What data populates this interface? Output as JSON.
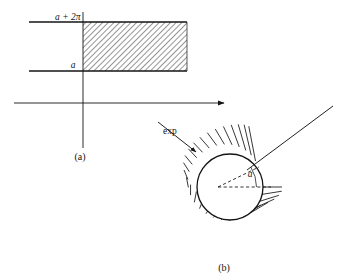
{
  "figure": {
    "background_color": "#ffffff",
    "ink_color": "#141414",
    "panels": [
      {
        "id": "panel-a",
        "caption": "(a)",
        "caption_x": 80,
        "caption_y": 160,
        "description": "horizontal strip in the complex plane between a and a + 2π, hatched to the right of the vertical axis",
        "labels": [
          {
            "name": "upper-bound-label",
            "text": "a + 2π",
            "x": 55,
            "y": 20,
            "style": "italic"
          },
          {
            "name": "lower-bound-label",
            "text": "a",
            "x": 73,
            "y": 68,
            "style": "italic"
          }
        ],
        "axes": {
          "horizontal_axis": {
            "x1": 14,
            "y1": 103,
            "x2": 228,
            "y2": 103,
            "arrow": "right"
          },
          "vertical_axis": {
            "x1": 83,
            "y1": 12,
            "x2": 83,
            "y2": 148,
            "arrow": "none"
          }
        },
        "strip": {
          "top_line": {
            "x1": 29,
            "y1": 22,
            "x2": 187,
            "y2": 22
          },
          "bottom_line": {
            "x1": 29,
            "y1": 71,
            "x2": 187,
            "y2": 71
          },
          "hatch_region": {
            "x": 83,
            "y": 22,
            "width": 104,
            "height": 49
          },
          "hatch_angle_deg": 45,
          "hatch_spacing": 4
        }
      },
      {
        "id": "panel-b",
        "caption": "(b)",
        "caption_x": 222,
        "caption_y": 271,
        "description": "circle with radial spokes (image of the strip under exp), a dashed radius at angle a from the dashed horizontal radius",
        "circle": {
          "cx": 230,
          "cy": 187,
          "r": 33
        },
        "spokes": {
          "count": 28,
          "inner_r": 33,
          "outer_r": 52
        },
        "angle_label": {
          "name": "angle-a-label",
          "text": "a",
          "x": 249,
          "y": 176,
          "style": "italic"
        },
        "angle_value_deg": 35,
        "dashed_radius_horizontal": {
          "from_cx": true,
          "to_x": 271,
          "to_y": 187
        },
        "dashed_radius_angled": {
          "from_cx": true,
          "to_x": 257,
          "to_y": 168
        },
        "exp_label": {
          "name": "exp-label",
          "text": "exp",
          "x": 163,
          "y": 132
        },
        "exp_arrow": {
          "x1": 160,
          "y1": 124,
          "x2": 198,
          "y2": 153,
          "arrow": "end"
        },
        "long_ray": {
          "x1": 247,
          "y1": 170,
          "x2": 333,
          "y2": 106
        }
      }
    ]
  }
}
